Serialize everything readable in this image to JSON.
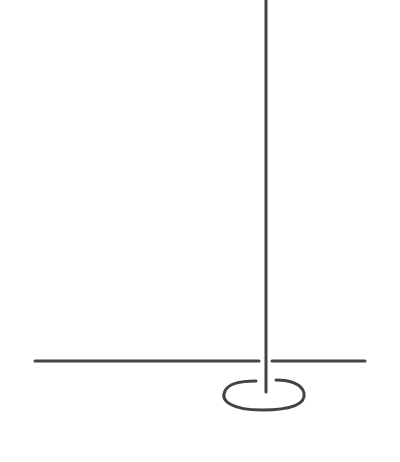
{
  "diagram": {
    "stroke_color": "#444444",
    "background": "#ffffff",
    "elements": {
      "vertical_line": {
        "x": 266,
        "y1": 0,
        "y2": 392,
        "stroke_width": 3
      },
      "horizontal_line_left": {
        "x1": 35,
        "x2": 259,
        "y": 361,
        "stroke_width": 3
      },
      "horizontal_line_right": {
        "x1": 272,
        "x2": 365,
        "y": 361,
        "stroke_width": 3
      },
      "base_loop": {
        "left_end": [
          256,
          382
        ],
        "right_end": [
          275,
          380
        ],
        "bbox": [
          222,
          379,
          305,
          411
        ],
        "stroke_width": 3
      }
    }
  }
}
